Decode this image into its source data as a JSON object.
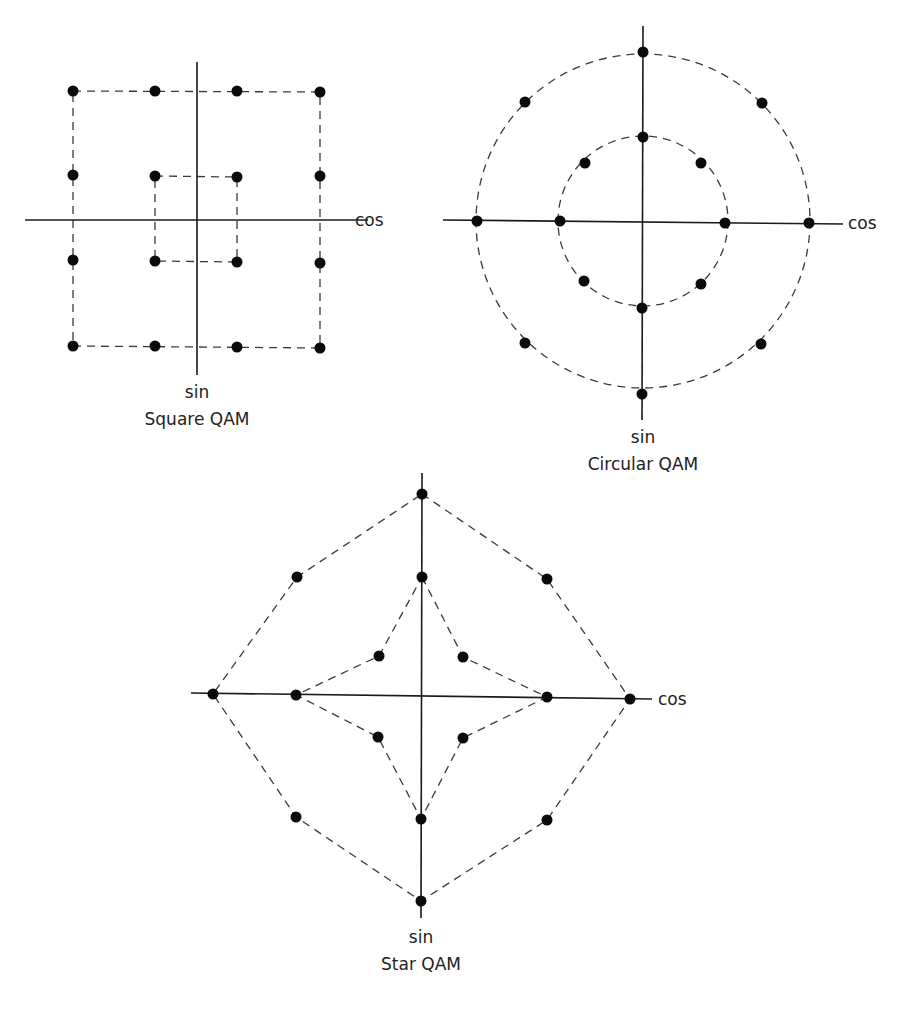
{
  "diagrams": {
    "square": {
      "title": "Square QAM",
      "x_axis_label": "cos",
      "y_axis_label": "sin",
      "points": [
        [
          73,
          91
        ],
        [
          155,
          91
        ],
        [
          237,
          91
        ],
        [
          320,
          92
        ],
        [
          73,
          175
        ],
        [
          155,
          176
        ],
        [
          237,
          177
        ],
        [
          320,
          176
        ],
        [
          73,
          260
        ],
        [
          155,
          261
        ],
        [
          237,
          262
        ],
        [
          320,
          263
        ],
        [
          73,
          346
        ],
        [
          155,
          346
        ],
        [
          237,
          347
        ],
        [
          320,
          348
        ]
      ],
      "outer_box": [
        [
          73,
          91
        ],
        [
          320,
          92
        ],
        [
          320,
          348
        ],
        [
          73,
          346
        ]
      ],
      "inner_box": [
        [
          155,
          176
        ],
        [
          237,
          177
        ],
        [
          237,
          262
        ],
        [
          155,
          261
        ]
      ],
      "axes": {
        "h": [
          25,
          220,
          368,
          220
        ],
        "v": [
          197,
          62,
          197,
          375
        ]
      }
    },
    "circular": {
      "title": "Circular QAM",
      "x_axis_label": "cos",
      "y_axis_label": "sin",
      "center": [
        643,
        221
      ],
      "outer_radius": 167,
      "inner_radius": 85,
      "points": [
        [
          643,
          52
        ],
        [
          525,
          102
        ],
        [
          762,
          103
        ],
        [
          643,
          137
        ],
        [
          585,
          163
        ],
        [
          701,
          163
        ],
        [
          477,
          221
        ],
        [
          560,
          221
        ],
        [
          725,
          223
        ],
        [
          809,
          223
        ],
        [
          584,
          281
        ],
        [
          701,
          284
        ],
        [
          642,
          308
        ],
        [
          525,
          343
        ],
        [
          761,
          344
        ],
        [
          642,
          394
        ]
      ],
      "axes": {
        "h": [
          443,
          220,
          843,
          224
        ],
        "v": [
          643,
          26,
          642,
          420
        ]
      }
    },
    "star": {
      "title": "Star QAM",
      "x_axis_label": "cos",
      "y_axis_label": "sin",
      "points": [
        [
          422,
          494
        ],
        [
          297,
          577
        ],
        [
          422,
          577
        ],
        [
          547,
          579
        ],
        [
          379,
          656
        ],
        [
          463,
          657
        ],
        [
          213,
          694
        ],
        [
          296,
          695
        ],
        [
          547,
          697
        ],
        [
          630,
          699
        ],
        [
          378,
          737
        ],
        [
          463,
          738
        ],
        [
          296,
          817
        ],
        [
          421,
          819
        ],
        [
          547,
          820
        ],
        [
          421,
          901
        ]
      ],
      "outer_octagon": [
        [
          422,
          494
        ],
        [
          547,
          579
        ],
        [
          630,
          699
        ],
        [
          547,
          820
        ],
        [
          421,
          901
        ],
        [
          296,
          817
        ],
        [
          213,
          694
        ],
        [
          297,
          577
        ]
      ],
      "inner_star": [
        [
          422,
          577
        ],
        [
          463,
          657
        ],
        [
          547,
          697
        ],
        [
          463,
          738
        ],
        [
          421,
          819
        ],
        [
          378,
          737
        ],
        [
          296,
          695
        ],
        [
          379,
          656
        ]
      ],
      "axes": {
        "h": [
          191,
          693,
          652,
          699
        ],
        "v": [
          422,
          473,
          421,
          918
        ]
      }
    }
  },
  "labels": {
    "square": {
      "sin": "sin",
      "cos": "cos",
      "title": "Square QAM"
    },
    "circular": {
      "sin": "sin",
      "cos": "cos",
      "title": "Circular QAM"
    },
    "star": {
      "sin": "sin",
      "cos": "cos",
      "title": "Star QAM"
    }
  },
  "colors": {
    "ink": "#0a0a0a",
    "dash": "#3a3a3a",
    "background": "#ffffff"
  }
}
